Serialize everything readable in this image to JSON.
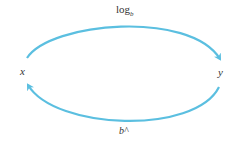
{
  "diagram": {
    "nodes": {
      "x": {
        "label": "x"
      },
      "y": {
        "label": "y"
      }
    },
    "edges": {
      "top": {
        "from": "x",
        "to": "y",
        "label_main": "log",
        "label_sub": "b"
      },
      "bottom": {
        "from": "y",
        "to": "x",
        "label": "b^"
      }
    },
    "colors": {
      "arrow": "#5bbfe0",
      "text": "#333333"
    }
  }
}
